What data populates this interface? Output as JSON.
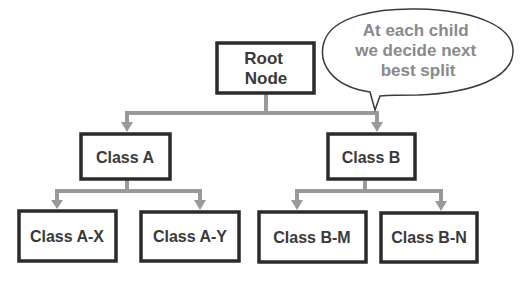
{
  "diagram": {
    "type": "decision-tree",
    "colors": {
      "background": "#ffffff",
      "box_border": "#2b2b2b",
      "box_text": "#3a3a3a",
      "connector": "#9a9a9a",
      "bubble_border": "#3a3a3a",
      "bubble_text": "#8a8a8a"
    },
    "nodes": {
      "root": {
        "line1": "Root",
        "line2": "Node"
      },
      "class_a": {
        "label": "Class A"
      },
      "class_b": {
        "label": "Class B"
      },
      "class_a_x": {
        "label": "Class A-X"
      },
      "class_a_y": {
        "label": "Class A-Y"
      },
      "class_b_m": {
        "label": "Class B-M"
      },
      "class_b_n": {
        "label": "Class B-N"
      }
    },
    "callout": {
      "line1": "At each child",
      "line2": "we decide next",
      "line3": "best split"
    },
    "edges": [
      {
        "from": "Root Node",
        "to": "Class A"
      },
      {
        "from": "Root Node",
        "to": "Class B"
      },
      {
        "from": "Class A",
        "to": "Class A-X"
      },
      {
        "from": "Class A",
        "to": "Class A-Y"
      },
      {
        "from": "Class B",
        "to": "Class B-M"
      },
      {
        "from": "Class B",
        "to": "Class B-N"
      }
    ]
  }
}
